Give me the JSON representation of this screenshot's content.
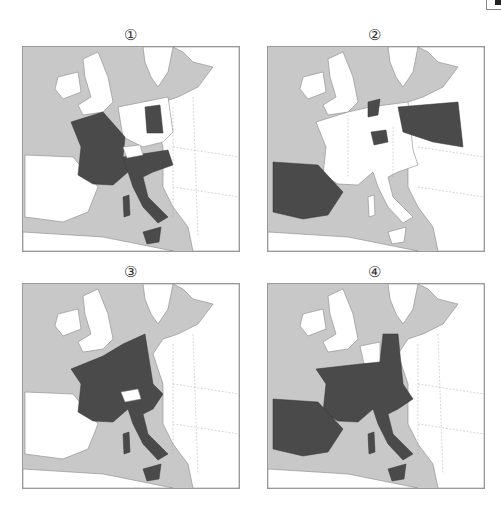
{
  "panels": [
    {
      "label": "①",
      "highlighted": [
        "France",
        "Italy",
        "Sardinia",
        "Sicily",
        "East Germany"
      ]
    },
    {
      "label": "②",
      "highlighted": [
        "Spain",
        "Portugal",
        "Switzerland",
        "Netherlands",
        "Poland"
      ]
    },
    {
      "label": "③",
      "highlighted": [
        "France",
        "Belgium",
        "Netherlands",
        "Luxembourg",
        "West Germany",
        "Italy",
        "Sardinia",
        "Sicily"
      ]
    },
    {
      "label": "④",
      "highlighted": [
        "France",
        "Spain",
        "Portugal",
        "Luxembourg",
        "West Germany",
        "Italy",
        "Sardinia",
        "Sicily",
        "Austria"
      ]
    }
  ],
  "colors": {
    "sea": "#c8c8c8",
    "land": "#ffffff",
    "highlight": "#4a4a4a",
    "border": "#999999"
  }
}
